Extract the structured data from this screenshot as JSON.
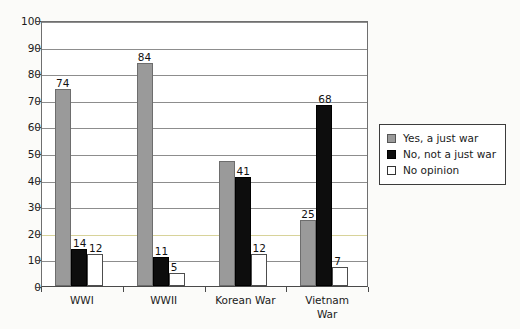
{
  "chart_data": {
    "type": "bar",
    "title": "",
    "subtitle": "",
    "xlabel": "",
    "ylabel": "",
    "ylim": [
      0,
      100
    ],
    "ytick_step": 10,
    "yticks": [
      "0",
      "10",
      "20",
      "30",
      "40",
      "50",
      "60",
      "70",
      "80",
      "90",
      "100"
    ],
    "grid": true,
    "grid_axis": "y",
    "legend_position": "right",
    "categories": [
      "WWI",
      "WWII",
      "Korean War",
      "Vietnam War"
    ],
    "category_label_lines": [
      [
        "WWI"
      ],
      [
        "WWII"
      ],
      [
        "Korean War"
      ],
      [
        "Vietnam",
        "War"
      ]
    ],
    "series": [
      {
        "name": "Yes, a just war",
        "key": "yes",
        "color": "#9a9a9a",
        "values": [
          74,
          84,
          47,
          25
        ],
        "labels": [
          "74",
          "84",
          "",
          "25"
        ]
      },
      {
        "name": "No, not a just war",
        "key": "no",
        "color": "#0d0d0d",
        "values": [
          14,
          11,
          41,
          68
        ],
        "labels": [
          "14",
          "11",
          "41",
          "68"
        ]
      },
      {
        "name": "No opinion",
        "key": "noop",
        "color": "#ffffff",
        "values": [
          12,
          5,
          12,
          7
        ],
        "labels": [
          "12",
          "5",
          "12",
          "7"
        ]
      }
    ]
  },
  "legend": {
    "items": [
      {
        "label": "Yes, a just war",
        "swatch": "series-yes"
      },
      {
        "label": "No, not a just war",
        "swatch": "series-no"
      },
      {
        "label": "No opinion",
        "swatch": "series-noop"
      }
    ]
  },
  "colors": {
    "series_yes": "#9a9a9a",
    "series_no": "#0d0d0d",
    "series_no_opinion": "#ffffff",
    "gridline": "#8d8d8d",
    "axis": "#4a4a4a",
    "plot_background": "#ffffff",
    "page_background": "#fbfbf9",
    "text": "#1a1a1a"
  }
}
